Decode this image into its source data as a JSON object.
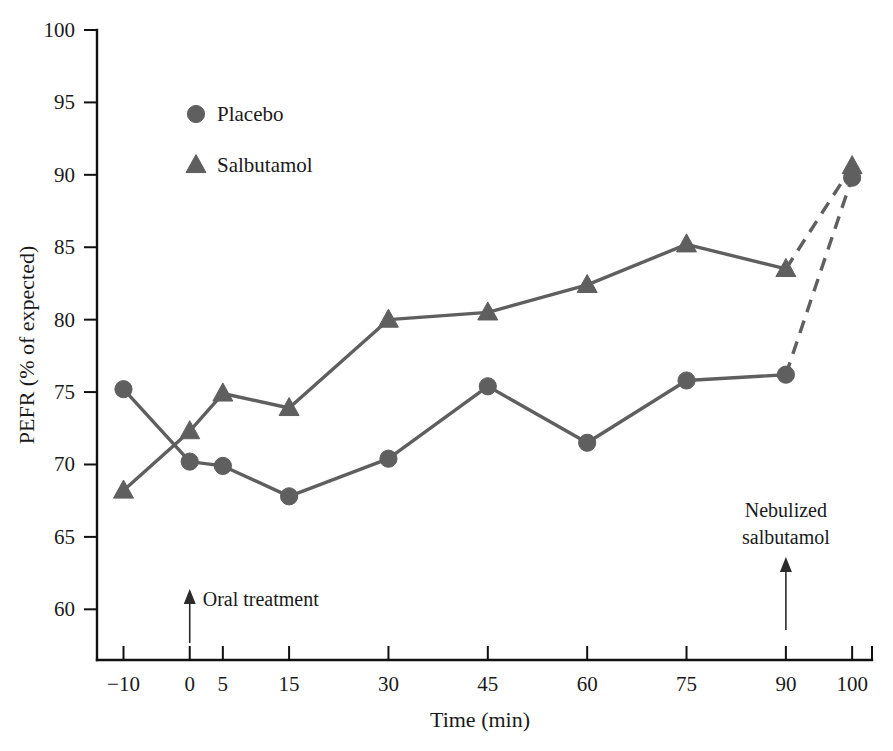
{
  "chart_data": {
    "type": "line",
    "title": "",
    "xlabel": "Time (min)",
    "ylabel": "PEFR (% of expected)",
    "xlim": [
      -14,
      103
    ],
    "ylim": [
      56.5,
      100
    ],
    "grid": false,
    "legend_position": "upper-left-inside",
    "x_ticks": [
      -10,
      0,
      5,
      15,
      30,
      45,
      60,
      75,
      90,
      100
    ],
    "x_tick_labels": [
      "−10",
      "0",
      "5",
      "15",
      "30",
      "45",
      "60",
      "75",
      "90",
      "100"
    ],
    "y_ticks": [
      60,
      65,
      70,
      75,
      80,
      85,
      90,
      95,
      100
    ],
    "y_tick_labels": [
      "60",
      "65",
      "70",
      "75",
      "80",
      "85",
      "90",
      "95",
      "100"
    ],
    "x": [
      -10,
      0,
      5,
      15,
      30,
      45,
      60,
      75,
      90,
      100
    ],
    "series": [
      {
        "name": "Placebo",
        "marker": "circle",
        "color": "#5f5f5f",
        "values": [
          75.2,
          70.2,
          69.9,
          67.8,
          70.4,
          75.4,
          71.5,
          75.8,
          76.2,
          89.8
        ],
        "dashed_from_index": 8
      },
      {
        "name": "Salbutamol",
        "marker": "triangle",
        "color": "#5f5f5f",
        "values": [
          68.2,
          72.3,
          74.9,
          73.9,
          80.0,
          80.5,
          82.4,
          85.2,
          83.5,
          90.6
        ],
        "dashed_from_index": 8
      }
    ],
    "annotations": [
      {
        "text": "Oral treatment",
        "at_x": 0,
        "arrow": "up"
      },
      {
        "text": "Nebulized\nsalbutamol",
        "at_x": 90,
        "arrow": "up"
      }
    ]
  },
  "legend": {
    "items": [
      {
        "label": "Placebo",
        "marker": "circle"
      },
      {
        "label": "Salbutamol",
        "marker": "triangle"
      }
    ]
  },
  "annotations": {
    "oral_treatment": "Oral treatment",
    "nebulized_line1": "Nebulized",
    "nebulized_line2": "salbutamol"
  },
  "axes": {
    "x_title": "Time (min)",
    "y_title": "PEFR (% of expected)"
  },
  "colors": {
    "series": "#5f5f5f",
    "axis": "#111111",
    "text": "#1a1a1a",
    "background": "#ffffff"
  }
}
